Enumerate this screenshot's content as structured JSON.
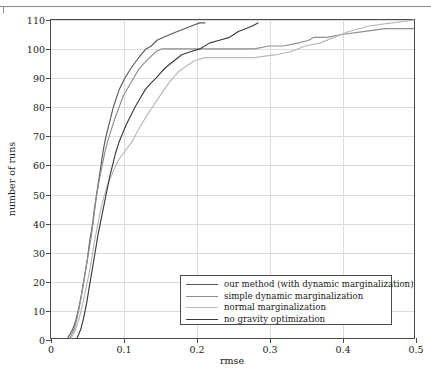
{
  "figure": {
    "axis_title_x": "rmse",
    "axis_title_y": "number of runs"
  },
  "chart_data": {
    "type": "line",
    "title": "",
    "xlabel": "rmse",
    "ylabel": "number of runs",
    "xlim": [
      0,
      0.5
    ],
    "ylim": [
      0,
      110
    ],
    "xticks": [
      0,
      0.1,
      0.2,
      0.3,
      0.4,
      0.5
    ],
    "xtick_labels": [
      "0",
      "0.1",
      "0.2",
      "0.3",
      "0.4",
      "0.5"
    ],
    "yticks": [
      0,
      10,
      20,
      30,
      40,
      50,
      60,
      70,
      80,
      90,
      100,
      110
    ],
    "ytick_labels": [
      "0",
      "10",
      "20",
      "30",
      "40",
      "50",
      "60",
      "70",
      "80",
      "90",
      "100",
      "110"
    ],
    "grid": true,
    "legend_position": "lower-center-right",
    "series": [
      {
        "name": "our method (with dynamic marginalization)",
        "color": "#5a5a5a",
        "points": [
          [
            0.023,
            0
          ],
          [
            0.03,
            3
          ],
          [
            0.034,
            6
          ],
          [
            0.038,
            10
          ],
          [
            0.042,
            15
          ],
          [
            0.046,
            21
          ],
          [
            0.05,
            27
          ],
          [
            0.053,
            33
          ],
          [
            0.057,
            39
          ],
          [
            0.06,
            45
          ],
          [
            0.063,
            50
          ],
          [
            0.066,
            55
          ],
          [
            0.069,
            60
          ],
          [
            0.072,
            65
          ],
          [
            0.075,
            69
          ],
          [
            0.079,
            73
          ],
          [
            0.083,
            77
          ],
          [
            0.086,
            80
          ],
          [
            0.09,
            83
          ],
          [
            0.094,
            86
          ],
          [
            0.098,
            88
          ],
          [
            0.102,
            90
          ],
          [
            0.107,
            92
          ],
          [
            0.112,
            94
          ],
          [
            0.118,
            96
          ],
          [
            0.124,
            98
          ],
          [
            0.131,
            100
          ],
          [
            0.138,
            101
          ],
          [
            0.146,
            103
          ],
          [
            0.155,
            104
          ],
          [
            0.164,
            105
          ],
          [
            0.174,
            106
          ],
          [
            0.184,
            107
          ],
          [
            0.194,
            108
          ],
          [
            0.205,
            109
          ],
          [
            0.212,
            109
          ]
        ]
      },
      {
        "name": "simple dynamic marginalization",
        "color": "#8f8f8f",
        "points": [
          [
            0.026,
            0
          ],
          [
            0.032,
            3
          ],
          [
            0.036,
            7
          ],
          [
            0.04,
            12
          ],
          [
            0.044,
            18
          ],
          [
            0.048,
            24
          ],
          [
            0.052,
            30
          ],
          [
            0.056,
            36
          ],
          [
            0.059,
            42
          ],
          [
            0.062,
            48
          ],
          [
            0.066,
            54
          ],
          [
            0.07,
            59
          ],
          [
            0.074,
            64
          ],
          [
            0.078,
            68
          ],
          [
            0.083,
            72
          ],
          [
            0.088,
            76
          ],
          [
            0.094,
            80
          ],
          [
            0.1,
            84
          ],
          [
            0.107,
            87
          ],
          [
            0.114,
            90
          ],
          [
            0.121,
            93
          ],
          [
            0.128,
            95
          ],
          [
            0.136,
            97
          ],
          [
            0.144,
            99
          ],
          [
            0.152,
            100
          ],
          [
            0.175,
            100
          ],
          [
            0.21,
            100
          ],
          [
            0.25,
            100
          ],
          [
            0.28,
            100
          ],
          [
            0.3,
            101
          ],
          [
            0.32,
            101
          ],
          [
            0.34,
            102
          ],
          [
            0.355,
            103
          ],
          [
            0.362,
            104
          ],
          [
            0.38,
            104
          ],
          [
            0.4,
            105
          ],
          [
            0.43,
            106
          ],
          [
            0.46,
            107
          ],
          [
            0.49,
            107
          ],
          [
            0.5,
            107
          ]
        ]
      },
      {
        "name": "normal marginalization",
        "color": "#b8b8b8",
        "points": [
          [
            0.028,
            0
          ],
          [
            0.034,
            3
          ],
          [
            0.039,
            7
          ],
          [
            0.044,
            12
          ],
          [
            0.048,
            17
          ],
          [
            0.053,
            23
          ],
          [
            0.057,
            29
          ],
          [
            0.061,
            35
          ],
          [
            0.065,
            40
          ],
          [
            0.069,
            45
          ],
          [
            0.073,
            49
          ],
          [
            0.078,
            53
          ],
          [
            0.083,
            56
          ],
          [
            0.088,
            59
          ],
          [
            0.094,
            62
          ],
          [
            0.1,
            64
          ],
          [
            0.106,
            66
          ],
          [
            0.112,
            68
          ],
          [
            0.118,
            71
          ],
          [
            0.125,
            74
          ],
          [
            0.132,
            77
          ],
          [
            0.14,
            80
          ],
          [
            0.148,
            83
          ],
          [
            0.156,
            86
          ],
          [
            0.165,
            89
          ],
          [
            0.175,
            92
          ],
          [
            0.186,
            94
          ],
          [
            0.198,
            96
          ],
          [
            0.212,
            97
          ],
          [
            0.24,
            97
          ],
          [
            0.28,
            97
          ],
          [
            0.31,
            98
          ],
          [
            0.33,
            99
          ],
          [
            0.35,
            101
          ],
          [
            0.37,
            102
          ],
          [
            0.39,
            104
          ],
          [
            0.41,
            106
          ],
          [
            0.44,
            108
          ],
          [
            0.47,
            109
          ],
          [
            0.5,
            110
          ]
        ]
      },
      {
        "name": "no gravity optimization",
        "color": "#3c3c3c",
        "points": [
          [
            0.036,
            0
          ],
          [
            0.041,
            3
          ],
          [
            0.045,
            7
          ],
          [
            0.049,
            12
          ],
          [
            0.053,
            18
          ],
          [
            0.057,
            24
          ],
          [
            0.061,
            30
          ],
          [
            0.065,
            36
          ],
          [
            0.069,
            41
          ],
          [
            0.073,
            46
          ],
          [
            0.077,
            51
          ],
          [
            0.081,
            56
          ],
          [
            0.085,
            60
          ],
          [
            0.089,
            64
          ],
          [
            0.094,
            68
          ],
          [
            0.099,
            71
          ],
          [
            0.104,
            74
          ],
          [
            0.11,
            77
          ],
          [
            0.116,
            80
          ],
          [
            0.123,
            83
          ],
          [
            0.13,
            86
          ],
          [
            0.137,
            88
          ],
          [
            0.145,
            90
          ],
          [
            0.152,
            92
          ],
          [
            0.16,
            94
          ],
          [
            0.17,
            96
          ],
          [
            0.18,
            98
          ],
          [
            0.192,
            99
          ],
          [
            0.205,
            100
          ],
          [
            0.218,
            102
          ],
          [
            0.232,
            103
          ],
          [
            0.246,
            104
          ],
          [
            0.258,
            106
          ],
          [
            0.268,
            107
          ],
          [
            0.278,
            108
          ],
          [
            0.285,
            109
          ]
        ]
      }
    ]
  },
  "legend": {
    "items": [
      {
        "label": "our method (with dynamic marginalization)",
        "color": "#5a5a5a"
      },
      {
        "label": "simple dynamic marginalization",
        "color": "#8f8f8f"
      },
      {
        "label": "normal marginalization",
        "color": "#b8b8b8"
      },
      {
        "label": "no gravity optimization",
        "color": "#3c3c3c"
      }
    ]
  }
}
